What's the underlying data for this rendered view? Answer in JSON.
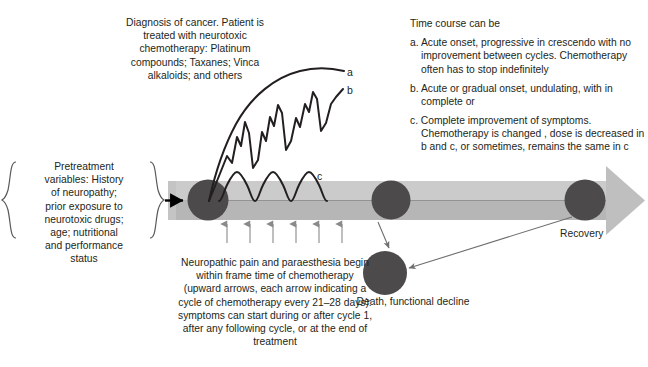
{
  "diagram": {
    "colors": {
      "timeline_band_light": "#c9c9c9",
      "timeline_band_dark": "#b5b5b5",
      "node_circle": "#4c4a4b",
      "curve_stroke": "#231f20",
      "text": "#231f20",
      "thin_arrow": "#6f6f6f"
    }
  },
  "diagnosis": {
    "lines": [
      "Diagnosis of cancer. Patient is",
      "treated with neurotoxic",
      "chemotherapy: Platinum",
      "compounds; Taxanes; Vinca",
      "alkaloids; and others"
    ]
  },
  "timecourse": {
    "heading": "Time course can be",
    "items": [
      "a. Acute onset, progressive in crescendo with no improvement between cycles. Chemotherapy often has to stop indefinitely",
      "b. Acute or gradual onset, undulating, with in complete or",
      "c. Complete improvement of symptoms. Chemotherapy is changed , dose is decreased in b and c, or sometimes, remains the same in c"
    ]
  },
  "pretreatment": {
    "lines": [
      "Pretreatment",
      "variables: History",
      "of neuropathy;",
      "prior exposure to",
      "neurotoxic drugs;",
      "age; nutritional",
      "and performance",
      "status"
    ]
  },
  "neuropathic": {
    "lines": [
      "Neuropathic pain and paraesthesia begin",
      "within frame time of chemotherapy",
      "(upward arrows, each arrow indicating a",
      "cycle of chemotherapy every 21–28 days):",
      "symptoms can start during or after cycle 1,",
      "after any following cycle, or  at the end of",
      "treatment"
    ]
  },
  "curve_labels": {
    "a": "a",
    "b": "b",
    "c": "c"
  },
  "outcomes": {
    "recovery": "Recovery",
    "death": "Death, functional decline"
  },
  "footer": {
    "caption": ""
  }
}
